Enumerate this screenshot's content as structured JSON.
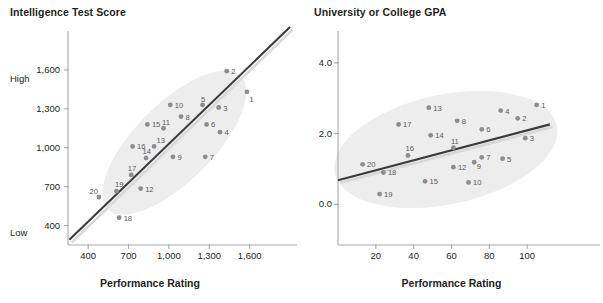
{
  "figure": {
    "background": "#ffffff",
    "point_color": "#8c8d8f",
    "line_color": "#3b3b3b",
    "ellipse_color": "#ededed",
    "axis_color": "#a7a9ac",
    "text_color": "#231f20",
    "label_color": "#58595b"
  },
  "chart_data": [
    {
      "type": "scatter",
      "title": "Intelligence Test Score",
      "xlabel": "Performance Rating",
      "ylabel": "Intelligence Test Score",
      "xticks": [
        "400",
        "700",
        "1,000",
        "1,300",
        "1,600"
      ],
      "xtick_values": [
        400,
        700,
        1000,
        1300,
        1600
      ],
      "yticks": [
        "400",
        "700",
        "1,000",
        "1,300",
        "1,600"
      ],
      "ytick_values": [
        400,
        700,
        1000,
        1300,
        1600
      ],
      "ylow_label": "Low",
      "yhigh_label": "High",
      "xlim": [
        250,
        1900
      ],
      "ylim": [
        250,
        1900
      ],
      "grid": false,
      "legend": "none",
      "trendline": {
        "x0": 260,
        "y0": 290,
        "x1": 1900,
        "y1": 1930
      },
      "ellipse": {
        "cx": 1040,
        "cy": 1040,
        "rx": 700,
        "ry": 300,
        "rotation_deg": -45
      },
      "points": [
        {
          "label": "1",
          "x": 1580,
          "y": 1430
        },
        {
          "label": "2",
          "x": 1430,
          "y": 1590
        },
        {
          "label": "3",
          "x": 1370,
          "y": 1310
        },
        {
          "label": "4",
          "x": 1380,
          "y": 1120
        },
        {
          "label": "5",
          "x": 1250,
          "y": 1330
        },
        {
          "label": "6",
          "x": 1280,
          "y": 1180
        },
        {
          "label": "7",
          "x": 1270,
          "y": 930
        },
        {
          "label": "8",
          "x": 1090,
          "y": 1240
        },
        {
          "label": "9",
          "x": 1030,
          "y": 930
        },
        {
          "label": "10",
          "x": 1010,
          "y": 1330
        },
        {
          "label": "11",
          "x": 960,
          "y": 1150
        },
        {
          "label": "12",
          "x": 790,
          "y": 685
        },
        {
          "label": "13",
          "x": 890,
          "y": 1010
        },
        {
          "label": "14",
          "x": 830,
          "y": 920
        },
        {
          "label": "15",
          "x": 840,
          "y": 1180
        },
        {
          "label": "16",
          "x": 730,
          "y": 1010
        },
        {
          "label": "17",
          "x": 720,
          "y": 790
        },
        {
          "label": "18",
          "x": 630,
          "y": 460
        },
        {
          "label": "19",
          "x": 610,
          "y": 665
        },
        {
          "label": "20",
          "x": 480,
          "y": 620
        }
      ]
    },
    {
      "type": "scatter",
      "title": "University or College GPA",
      "xlabel": "Performance Rating",
      "ylabel": "University or College GPA",
      "xticks": [
        "20",
        "40",
        "60",
        "80",
        "100"
      ],
      "xtick_values": [
        20,
        40,
        60,
        80,
        100
      ],
      "yticks": [
        "0.0",
        "2.0",
        "4.0"
      ],
      "ytick_values": [
        0.0,
        2.0,
        4.0
      ],
      "xlim": [
        0,
        120
      ],
      "ylim": [
        -1.15,
        4.9
      ],
      "grid": false,
      "legend": "none",
      "trendline": {
        "x0": 0,
        "y0": 0.68,
        "x1": 112,
        "y1": 2.26
      },
      "ellipse": {
        "cx": 57,
        "cy": 1.55,
        "rx": 60,
        "ry": 1.55,
        "rotation_deg": -12
      },
      "points": [
        {
          "label": "1",
          "x": 105,
          "y": 2.81
        },
        {
          "label": "2",
          "x": 95,
          "y": 2.43
        },
        {
          "label": "3",
          "x": 99,
          "y": 1.87
        },
        {
          "label": "4",
          "x": 86,
          "y": 2.65
        },
        {
          "label": "5",
          "x": 87,
          "y": 1.29
        },
        {
          "label": "6",
          "x": 76,
          "y": 2.12
        },
        {
          "label": "7",
          "x": 76,
          "y": 1.33
        },
        {
          "label": "8",
          "x": 63,
          "y": 2.36
        },
        {
          "label": "9",
          "x": 72,
          "y": 1.19
        },
        {
          "label": "10",
          "x": 69,
          "y": 0.62
        },
        {
          "label": "11",
          "x": 61,
          "y": 1.6
        },
        {
          "label": "12",
          "x": 61,
          "y": 1.05
        },
        {
          "label": "13",
          "x": 48,
          "y": 2.73
        },
        {
          "label": "14",
          "x": 49,
          "y": 1.95
        },
        {
          "label": "15",
          "x": 46,
          "y": 0.65
        },
        {
          "label": "16",
          "x": 37,
          "y": 1.38
        },
        {
          "label": "17",
          "x": 32,
          "y": 2.26
        },
        {
          "label": "18",
          "x": 24,
          "y": 0.9
        },
        {
          "label": "19",
          "x": 22,
          "y": 0.29
        },
        {
          "label": "20",
          "x": 13,
          "y": 1.13
        }
      ]
    }
  ]
}
